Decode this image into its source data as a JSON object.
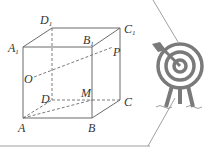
{
  "figure": {
    "labels": {
      "A1": "A",
      "B1": "B",
      "C1": "C",
      "D1": "D",
      "A": "A",
      "B": "B",
      "C": "C",
      "D": "D",
      "O": "O",
      "P": "P",
      "M": "M",
      "sub1": "1"
    },
    "colors": {
      "line": "#6b6b6b",
      "target": "#7a7a7a",
      "frame": "#888888"
    }
  }
}
